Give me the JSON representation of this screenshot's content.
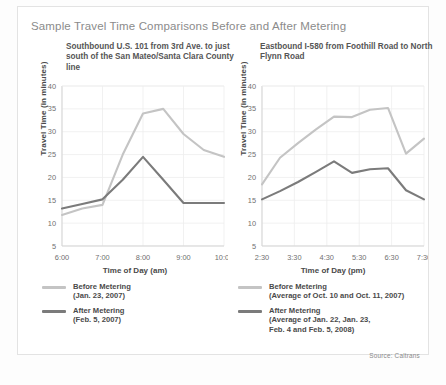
{
  "figure": {
    "title": "Sample Travel Time Comparisons Before and After Metering",
    "source": "Source: Caltrans"
  },
  "colors": {
    "before": "#c4c4c4",
    "after": "#7b7b7b",
    "grid": "#ededed",
    "axis": "#d5d5d5",
    "text": "#4a4a4a",
    "title": "#8b8b8b"
  },
  "panels": [
    {
      "id": "left",
      "subtitle": "Southbound U.S. 101 from 3rd Ave.\nto just south of the San Mateo/Santa\nClara County line",
      "ylabel": "Travel Time (in minutes)",
      "xlabel": "Time of Day (am)",
      "yticks": [
        40,
        35,
        30,
        25,
        20,
        15,
        10,
        5
      ],
      "ylim": [
        5,
        40
      ],
      "xticks": [
        "6:00",
        "7:00",
        "8:00",
        "9:00",
        "10:00"
      ],
      "legend": [
        {
          "label": "Before Metering\n(Jan. 23, 2007)",
          "series": "before"
        },
        {
          "label": "After Metering\n(Feb. 5, 2007)",
          "series": "after"
        }
      ],
      "chart_data": {
        "type": "line",
        "title": "Southbound U.S. 101 from 3rd Ave. to just south of the San Mateo/Santa Clara County line",
        "xlabel": "Time of Day (am)",
        "ylabel": "Travel Time (in minutes)",
        "ylim": [
          5,
          40
        ],
        "grid": true,
        "legend_position": "below",
        "x": [
          "6:00",
          "6:30",
          "7:00",
          "7:30",
          "8:00",
          "8:30",
          "9:00",
          "9:30",
          "10:00"
        ],
        "series": [
          {
            "name": "Before Metering (Jan. 23, 2007)",
            "color": "#c4c4c4",
            "values": [
              11.8,
              13.2,
              14.0,
              25.0,
              34.0,
              35.0,
              29.5,
              26.0,
              24.5
            ]
          },
          {
            "name": "After Metering (Feb. 5, 2007)",
            "color": "#7b7b7b",
            "values": [
              13.2,
              14.2,
              15.2,
              19.5,
              24.5,
              19.5,
              14.4,
              14.4,
              14.4
            ]
          }
        ]
      }
    },
    {
      "id": "right",
      "subtitle": "Eastbound I-580 from Foothill Road\nto North Flynn Road",
      "ylabel": "Travel Time (in minutes)",
      "xlabel": "Time of Day (pm)",
      "yticks": [
        40,
        35,
        30,
        25,
        20,
        15,
        10,
        5
      ],
      "ylim": [
        5,
        40
      ],
      "xticks": [
        "2:30",
        "3:30",
        "4:30",
        "5:30",
        "6:30",
        "7:30"
      ],
      "legend": [
        {
          "label": "Before Metering\n(Average of Oct. 10 and Oct. 11, 2007)",
          "series": "before"
        },
        {
          "label": "After Metering\n(Average of Jan. 22, Jan. 23,\n Feb. 4 and Feb. 5, 2008)",
          "series": "after"
        }
      ],
      "chart_data": {
        "type": "line",
        "title": "Eastbound I-580 from Foothill Road to North Flynn Road",
        "xlabel": "Time of Day (pm)",
        "ylabel": "Travel Time (in minutes)",
        "ylim": [
          5,
          40
        ],
        "grid": true,
        "legend_position": "below",
        "x": [
          "2:30",
          "3:00",
          "3:30",
          "4:00",
          "4:30",
          "5:00",
          "5:30",
          "6:00",
          "6:30",
          "7:00"
        ],
        "series": [
          {
            "name": "Before Metering (Average of Oct. 10 and Oct. 11, 2007)",
            "color": "#c4c4c4",
            "values": [
              18.5,
              24.3,
              27.5,
              30.5,
              33.3,
              33.2,
              34.8,
              35.2,
              25.2,
              28.5
            ]
          },
          {
            "name": "After Metering (Average of Jan. 22, Jan. 23, Feb. 4 and Feb. 5, 2008)",
            "color": "#7b7b7b",
            "values": [
              15.2,
              17.0,
              19.0,
              21.2,
              23.5,
              21.0,
              21.8,
              22.0,
              17.2,
              15.2
            ]
          }
        ]
      }
    }
  ]
}
